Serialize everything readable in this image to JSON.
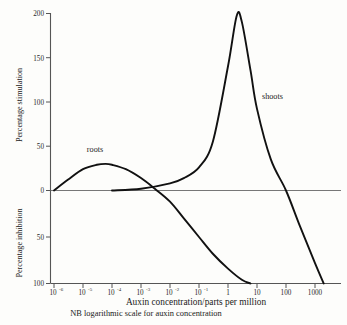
{
  "chart_data": {
    "type": "line",
    "title": "",
    "xlabel": "Auxin concentration/parts per million",
    "ylabel_upper": "Percentage stimulation",
    "ylabel_lower": "Percentage inhibition",
    "note": "NB logarithmic scale for auxin concentration",
    "xscale": "log",
    "xlim": [
      1e-06,
      10000
    ],
    "ylim": [
      -100,
      200
    ],
    "grid": false,
    "legend_position": "inline-annotations",
    "x_tick_labels": [
      "10–6",
      "10–5",
      "10–4",
      "10–3",
      "10–2",
      "10–1",
      "1",
      "10",
      "100",
      "1000"
    ],
    "x_tick_mantissas": [
      "10",
      "10",
      "10",
      "10",
      "10",
      "10",
      "1",
      "10",
      "100",
      "1000"
    ],
    "x_tick_exponents": [
      "-6",
      "-5",
      "-4",
      "-3",
      "-2",
      "-1",
      "",
      "",
      "",
      ""
    ],
    "x_tick_values": [
      1e-06,
      1e-05,
      0.0001,
      0.001,
      0.01,
      0.1,
      1,
      10,
      100,
      1000
    ],
    "y_tick_labels_upper": [
      "200",
      "150",
      "100",
      "50",
      "0"
    ],
    "y_tick_values_upper": [
      200,
      150,
      100,
      50,
      0
    ],
    "y_tick_labels_lower": [
      "50",
      "100"
    ],
    "y_tick_values_lower": [
      -50,
      -100
    ],
    "series": [
      {
        "name": "roots",
        "label": "roots",
        "peak_value": 30,
        "peak_x": 6e-05,
        "x": [
          1e-06,
          3e-06,
          1e-05,
          3e-05,
          6e-05,
          0.0001,
          0.0003,
          0.001,
          0.003,
          0.01,
          0.03,
          0.1,
          0.3,
          1,
          3,
          6
        ],
        "y": [
          0,
          12,
          24,
          29,
          30,
          29,
          24,
          14,
          2,
          -12,
          -30,
          -50,
          -68,
          -84,
          -96,
          -100
        ]
      },
      {
        "name": "shoots",
        "label": "shoots",
        "peak_value": 197,
        "peak_x": 2,
        "x": [
          0.0001,
          0.001,
          0.01,
          0.03,
          0.1,
          0.3,
          1,
          2,
          3,
          6,
          10,
          30,
          100,
          300,
          1000,
          2000
        ],
        "y": [
          0,
          2,
          8,
          14,
          26,
          55,
          140,
          197,
          190,
          135,
          92,
          35,
          0,
          -38,
          -78,
          -100
        ]
      }
    ],
    "annotations": [
      {
        "text": "roots",
        "x": 3e-05,
        "y": 45
      },
      {
        "text": "shoots",
        "x": 20,
        "y": 105
      }
    ]
  }
}
